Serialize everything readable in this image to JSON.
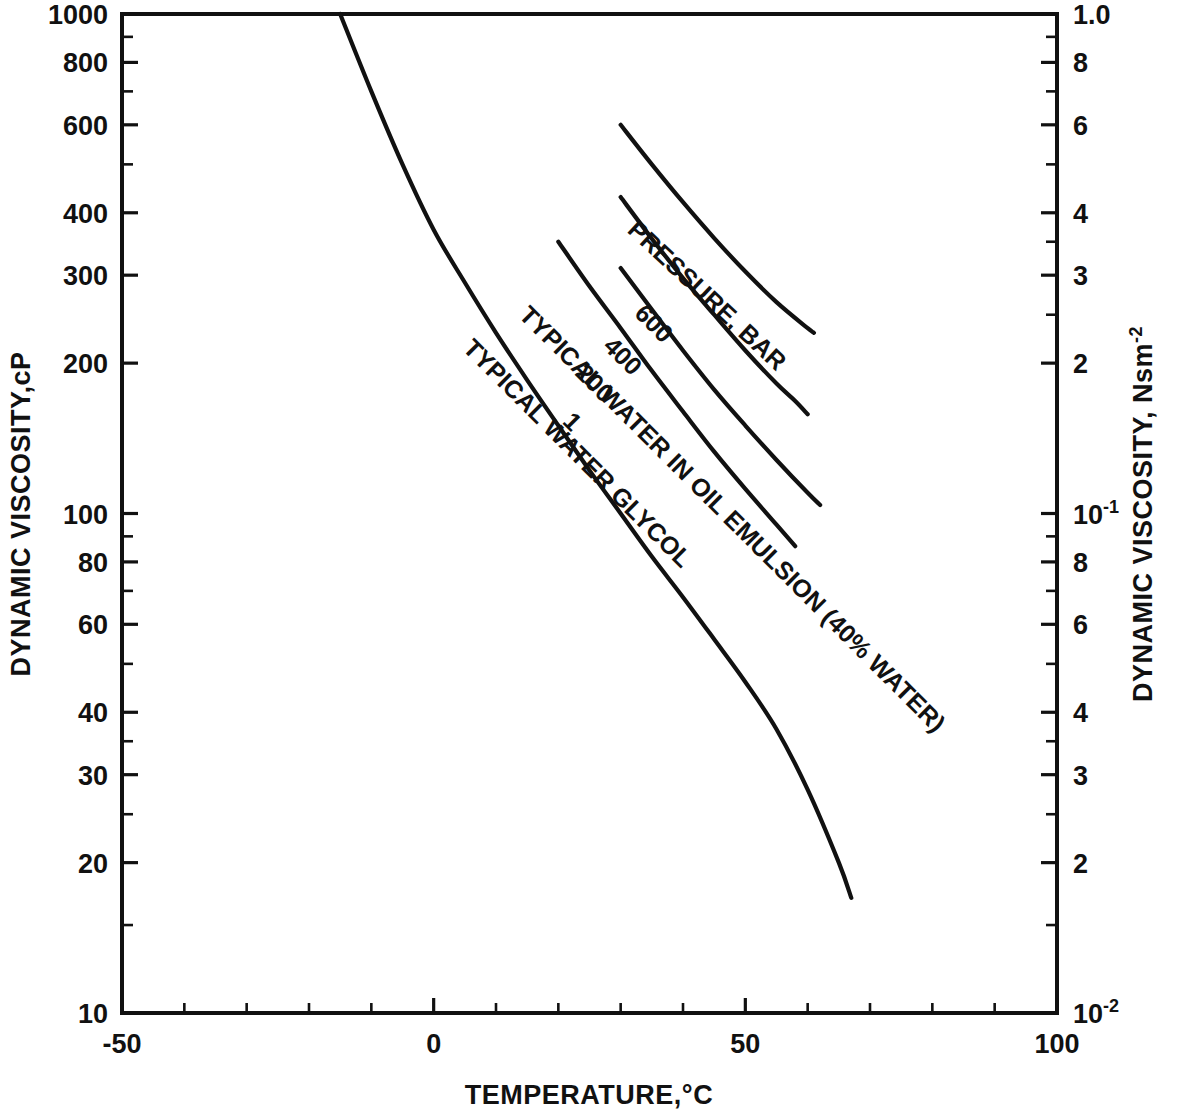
{
  "chart_data": {
    "type": "line",
    "title": "",
    "xlabel": "TEMPERATURE,°C",
    "ylabel_left": "DYNAMIC VISCOSITY,cP",
    "ylabel_right": "DYNAMIC VISCOSITY, Nsm",
    "ylabel_right_exponent": "-2",
    "xlim": [
      -50,
      100
    ],
    "ylim_left_cP": [
      10,
      1000
    ],
    "ylim_right_Nsm2": [
      0.01,
      1.0
    ],
    "x_scale": "linear",
    "y_scale": "log",
    "grid": false,
    "legend": "inline curve labels",
    "x_major_ticks": [
      -50,
      0,
      50,
      100
    ],
    "x_major_tick_labels": [
      "-50",
      "0",
      "50",
      "100"
    ],
    "x_minor_tick_step": 10,
    "y_left_tick_labels": [
      "1000",
      "800",
      "600",
      "400",
      "300",
      "200",
      "100",
      "80",
      "60",
      "40",
      "30",
      "20",
      "10"
    ],
    "y_left_tick_values": [
      1000,
      800,
      600,
      400,
      300,
      200,
      100,
      80,
      60,
      40,
      30,
      20,
      10
    ],
    "y_left_minor_tick_values": [
      900,
      700,
      500,
      90,
      70,
      50,
      35,
      25,
      15
    ],
    "y_right_tick_labels": [
      "1.0",
      "8",
      "6",
      "4",
      "3",
      "2",
      "10⁻¹",
      "8",
      "6",
      "4",
      "3",
      "2",
      "10⁻²"
    ],
    "y_right_tick_values": [
      1.0,
      0.8,
      0.6,
      0.4,
      0.3,
      0.2,
      0.1,
      0.08,
      0.06,
      0.04,
      0.03,
      0.02,
      0.01
    ],
    "y_right_minor_tick_values": [
      0.9,
      0.7,
      0.5,
      0.35,
      0.25,
      0.09,
      0.07,
      0.05,
      0.035,
      0.025,
      0.015
    ],
    "annotation_pressure": "PRESSURE, BAR",
    "series": [
      {
        "name": "TYPICAL WATER GLYCOL",
        "label": "TYPICAL WATER GLYCOL",
        "points": [
          [
            -15,
            1000
          ],
          [
            -10,
            700
          ],
          [
            -5,
            500
          ],
          [
            0,
            370
          ],
          [
            5,
            290
          ],
          [
            10,
            230
          ],
          [
            15,
            185
          ],
          [
            20,
            150
          ],
          [
            25,
            122
          ],
          [
            30,
            100
          ],
          [
            35,
            82
          ],
          [
            40,
            68
          ],
          [
            45,
            56
          ],
          [
            50,
            46
          ],
          [
            55,
            37
          ],
          [
            60,
            28
          ],
          [
            65,
            20
          ],
          [
            67,
            17
          ]
        ]
      },
      {
        "name": "TYPICAL WATER IN OIL EMULSION (40% WATER)",
        "label": "TYPICAL WATER IN OIL EMULSION (40% WATER)",
        "pressure_bar": "1",
        "points": [
          [
            20,
            350
          ],
          [
            25,
            285
          ],
          [
            30,
            235
          ],
          [
            35,
            193
          ],
          [
            40,
            160
          ],
          [
            45,
            133
          ],
          [
            50,
            112
          ],
          [
            55,
            95
          ],
          [
            58,
            86
          ]
        ]
      },
      {
        "name": "200 bar",
        "label": "200",
        "pressure_bar": "200",
        "points": [
          [
            30,
            310
          ],
          [
            35,
            256
          ],
          [
            40,
            212
          ],
          [
            45,
            177
          ],
          [
            50,
            150
          ],
          [
            55,
            128
          ],
          [
            60,
            110
          ],
          [
            62,
            104
          ]
        ]
      },
      {
        "name": "400 bar",
        "label": "400",
        "pressure_bar": "400",
        "points": [
          [
            30,
            430
          ],
          [
            35,
            355
          ],
          [
            40,
            296
          ],
          [
            45,
            250
          ],
          [
            50,
            212
          ],
          [
            55,
            182
          ],
          [
            58,
            168
          ],
          [
            60,
            158
          ]
        ]
      },
      {
        "name": "600 bar",
        "label": "600",
        "pressure_bar": "600",
        "points": [
          [
            30,
            600
          ],
          [
            35,
            500
          ],
          [
            40,
            420
          ],
          [
            45,
            356
          ],
          [
            50,
            305
          ],
          [
            55,
            265
          ],
          [
            60,
            235
          ],
          [
            61,
            230
          ]
        ]
      }
    ]
  },
  "colors": {
    "ink": "#111111",
    "background": "#ffffff"
  }
}
